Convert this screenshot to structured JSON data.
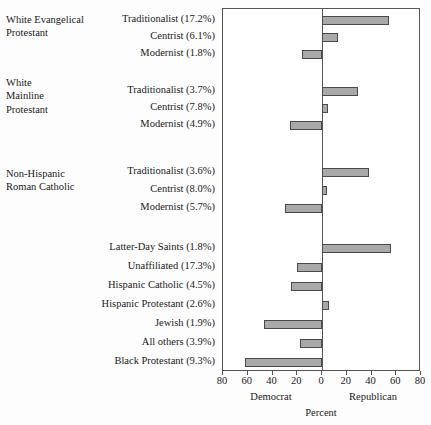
{
  "chart_data": {
    "type": "bar",
    "title": "",
    "subtitle": "",
    "orientation": "horizontal",
    "xlabel": "Percent",
    "ylabel": "",
    "xlim": [
      -80,
      80
    ],
    "xticks": [
      -80,
      -60,
      -40,
      -20,
      0,
      20,
      40,
      60,
      80
    ],
    "xtick_labels": [
      "80",
      "60",
      "40",
      "20",
      "0",
      "20",
      "40",
      "60",
      "80"
    ],
    "grid": false,
    "legend": null,
    "axis_side_labels": {
      "left": "Democrat",
      "right": "Republican"
    },
    "note": "Negative values extend left (Democrat); positive values extend right (Republican).",
    "groups": [
      {
        "name": "White Evangelical\nProtestant",
        "name_lines": [
          "White Evangelical",
          "Protestant"
        ],
        "categories": [
          {
            "label": "Traditionalist (17.2%)",
            "share_pct": 17.2,
            "value": 54
          },
          {
            "label": "Centrist (6.1%)",
            "share_pct": 6.1,
            "value": 13
          },
          {
            "label": "Modernist (1.8%)",
            "share_pct": 1.8,
            "value": -16
          }
        ]
      },
      {
        "name": "White\nMainline\nProtestant",
        "name_lines": [
          "White",
          "Mainline",
          "Protestant"
        ],
        "categories": [
          {
            "label": "Traditionalist (3.7%)",
            "share_pct": 3.7,
            "value": 29
          },
          {
            "label": "Centrist (7.8%)",
            "share_pct": 7.8,
            "value": 5
          },
          {
            "label": "Modernist (4.9%)",
            "share_pct": 4.9,
            "value": -26
          }
        ]
      },
      {
        "name": "Non-Hispanic\nRoman Catholic",
        "name_lines": [
          "Non-Hispanic",
          "Roman Catholic"
        ],
        "categories": [
          {
            "label": "Traditionalist (3.6%)",
            "share_pct": 3.6,
            "value": 38
          },
          {
            "label": "Centrist (8.0%)",
            "share_pct": 8.0,
            "value": 4
          },
          {
            "label": "Modernist (5.7%)",
            "share_pct": 5.7,
            "value": -30
          }
        ]
      },
      {
        "name": "",
        "name_lines": [],
        "categories": [
          {
            "label": "Latter-Day Saints (1.8%)",
            "share_pct": 1.8,
            "value": 56
          },
          {
            "label": "Unaffiliated (17.3%)",
            "share_pct": 17.3,
            "value": -20
          },
          {
            "label": "Hispanic Catholic (4.5%)",
            "share_pct": 4.5,
            "value": -25
          },
          {
            "label": "Hispanic Protestant (2.6%)",
            "share_pct": 2.6,
            "value": 6
          },
          {
            "label": "Jewish (1.9%)",
            "share_pct": 1.9,
            "value": -47
          },
          {
            "label": "All others (3.9%)",
            "share_pct": 3.9,
            "value": -18
          },
          {
            "label": "Black Protestant (9.3%)",
            "share_pct": 9.3,
            "value": -62
          }
        ]
      }
    ]
  }
}
